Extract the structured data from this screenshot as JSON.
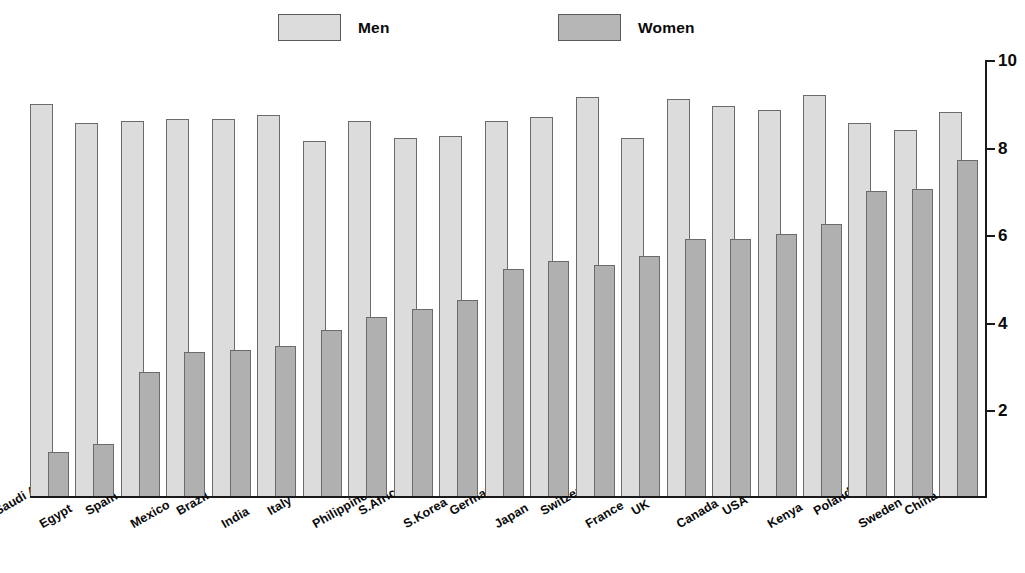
{
  "legend": {
    "entries": [
      {
        "label": "Men",
        "color": "#dcdcdc",
        "icon": "legend-swatch-icon"
      },
      {
        "label": "Women",
        "color": "#b0b0b0",
        "icon": "legend-swatch-icon"
      }
    ]
  },
  "axis": {
    "tick_labels": [
      "10",
      "8",
      "6",
      "4",
      "2"
    ],
    "tick_values": [
      10,
      8,
      6,
      4,
      2
    ],
    "position": "right"
  },
  "chart_data": {
    "type": "bar",
    "title": "",
    "subtitle": "",
    "xlabel": "",
    "ylabel": "",
    "ylim": [
      0,
      10
    ],
    "grid": false,
    "legend_position": "top",
    "orientation": "vertical",
    "grouping": "overlapping-grouped",
    "axis_side": "right",
    "tick_labels": [
      "10",
      "8",
      "6",
      "4",
      "2"
    ],
    "categories": [
      "Saudi Arabia",
      "Egypt",
      "Spain",
      "Mexico",
      "Brazil",
      "India",
      "Italy",
      "Philippines",
      "S.Africa",
      "S.Korea",
      "Germany",
      "Japan",
      "Switzerland",
      "France",
      "UK",
      "Canada",
      "USA",
      "Kenya",
      "Poland",
      "Sweden",
      "China"
    ],
    "series": [
      {
        "name": "Men",
        "color": "#dcdcdc",
        "values": [
          9.0,
          8.55,
          8.6,
          8.65,
          8.65,
          8.75,
          8.15,
          8.6,
          8.2,
          8.25,
          8.6,
          8.7,
          9.15,
          8.2,
          9.1,
          8.95,
          8.85,
          9.2,
          8.55,
          8.4,
          8.8
        ]
      },
      {
        "name": "Women",
        "color": "#b0b0b0",
        "values": [
          1.0,
          1.2,
          2.85,
          3.3,
          3.35,
          3.45,
          3.8,
          4.1,
          4.3,
          4.5,
          5.2,
          5.4,
          5.3,
          5.5,
          5.9,
          5.9,
          6.0,
          6.25,
          7.0,
          7.05,
          7.7
        ]
      }
    ]
  }
}
